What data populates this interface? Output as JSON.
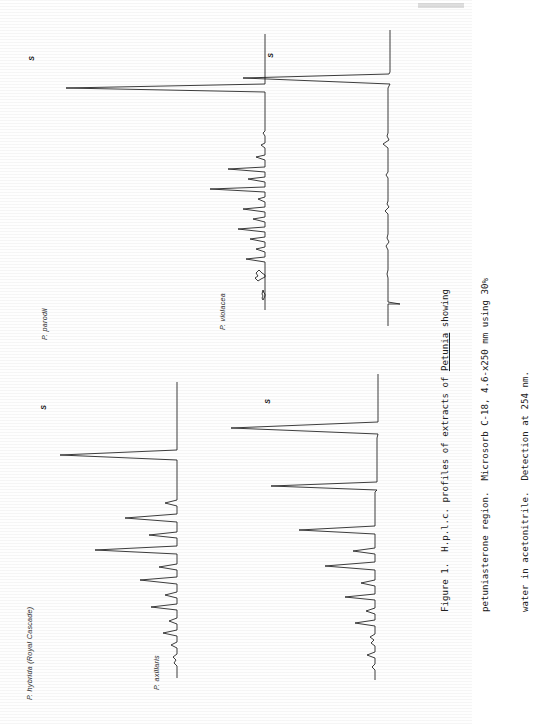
{
  "figure": {
    "caption_lines": [
      "Figure 1.  H.p.l.c. profiles of extracts of Petunia showing",
      "petuniasterone region.  Microsorb C-18, 4.6-x250 mm using 30%",
      "water in acetonitrile.  Detection at 254 nm."
    ],
    "caption_underlined_word": "Petunia",
    "figure_number": "Figure 1.",
    "technique": "H.p.l.c.",
    "analyte_region": "petuniasterone region",
    "column": "Microsorb C-18, 4.6-x250 mm",
    "mobile_phase": "30% water in acetonitrile",
    "detection": "Detection at 254 nm",
    "detection_wavelength": "254 nm"
  },
  "panels": [
    {
      "id": "p-hybrida",
      "label": "P. hybrida (Royal Cascade)",
      "solvent_marker": "S",
      "position": "bottom-left"
    },
    {
      "id": "p-parodii",
      "label": "P. parodii",
      "solvent_marker": "S",
      "position": "top-left"
    },
    {
      "id": "p-axillaris",
      "label": "P. axillaris",
      "solvent_marker": "S",
      "position": "bottom-right"
    },
    {
      "id": "p-violacea",
      "label": "P. violacea",
      "solvent_marker": "S",
      "position": "top-right"
    }
  ],
  "chart_data": {
    "type": "line",
    "title": "H.p.l.c. profiles of extracts of Petunia showing petuniasterone region",
    "xlabel": "Retention time",
    "ylabel": "Absorbance at 254 nm",
    "orientation": "rotated-90-ccw",
    "grid": false,
    "legend": "none",
    "axis_note": "Time axis runs vertically (bottom to top); detector response runs horizontally.",
    "series": [
      {
        "name": "P. hybrida (Royal Cascade)",
        "solvent_peak_label": "S",
        "peaks": [
          {
            "t": 3,
            "h": 6
          },
          {
            "t": 6,
            "h": 9
          },
          {
            "t": 9,
            "h": 14
          },
          {
            "t": 12,
            "h": 10
          },
          {
            "t": 15,
            "h": 21
          },
          {
            "t": 18,
            "h": 13
          },
          {
            "t": 21,
            "h": 30
          },
          {
            "t": 24,
            "h": 17
          },
          {
            "t": 28,
            "h": 55
          },
          {
            "t": 33,
            "h": 26
          },
          {
            "t": 38,
            "h": 40
          },
          {
            "t": 45,
            "h": 12
          },
          {
            "t": 62,
            "h": 96
          }
        ]
      },
      {
        "name": "P. parodii",
        "solvent_peak_label": "S",
        "peaks": [
          {
            "t": 4,
            "h": 8
          },
          {
            "t": 7,
            "h": 12
          },
          {
            "t": 10,
            "h": 18
          },
          {
            "t": 13,
            "h": 26
          },
          {
            "t": 16,
            "h": 15
          },
          {
            "t": 19,
            "h": 33
          },
          {
            "t": 22,
            "h": 20
          },
          {
            "t": 25,
            "h": 28
          },
          {
            "t": 28,
            "h": 17
          },
          {
            "t": 31,
            "h": 45
          },
          {
            "t": 35,
            "h": 24
          },
          {
            "t": 39,
            "h": 30
          },
          {
            "t": 44,
            "h": 18
          },
          {
            "t": 50,
            "h": 9
          },
          {
            "t": 62,
            "h": 97
          }
        ]
      },
      {
        "name": "P. axillaris",
        "solvent_peak_label": "S",
        "peaks": [
          {
            "t": 3,
            "h": 5
          },
          {
            "t": 6,
            "h": 8
          },
          {
            "t": 9,
            "h": 11
          },
          {
            "t": 12,
            "h": 16
          },
          {
            "t": 15,
            "h": 22
          },
          {
            "t": 18,
            "h": 14
          },
          {
            "t": 22,
            "h": 29
          },
          {
            "t": 26,
            "h": 20
          },
          {
            "t": 30,
            "h": 35
          },
          {
            "t": 35,
            "h": 25
          },
          {
            "t": 41,
            "h": 44
          },
          {
            "t": 48,
            "h": 30
          },
          {
            "t": 62,
            "h": 95
          }
        ]
      },
      {
        "name": "P. violacea",
        "solvent_peak_label": "S",
        "peaks": [
          {
            "t": 8,
            "h": 4
          },
          {
            "t": 14,
            "h": 3
          },
          {
            "t": 20,
            "h": 5
          },
          {
            "t": 27,
            "h": 3
          },
          {
            "t": 34,
            "h": 4
          },
          {
            "t": 41,
            "h": 6
          },
          {
            "t": 62,
            "h": 98
          }
        ]
      }
    ]
  }
}
